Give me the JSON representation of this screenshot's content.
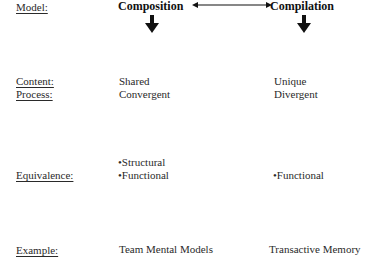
{
  "rows": {
    "model": {
      "label": "Model:",
      "left": "Composition",
      "right": "Compilation"
    },
    "content": {
      "label": "Content:",
      "left": "Shared",
      "right": "Unique"
    },
    "process": {
      "label": "Process:",
      "left": "Convergent",
      "right": "Divergent"
    },
    "equivalence": {
      "label": "Equivalence:",
      "left": [
        "•Structural",
        "•Functional"
      ],
      "right": [
        "•Functional"
      ]
    },
    "example": {
      "label": "Example:",
      "left": "Team Mental Models",
      "right": "Transactive Memory"
    }
  },
  "arrows": {
    "between_models": "double-headed-horizontal",
    "below_models": "down"
  }
}
